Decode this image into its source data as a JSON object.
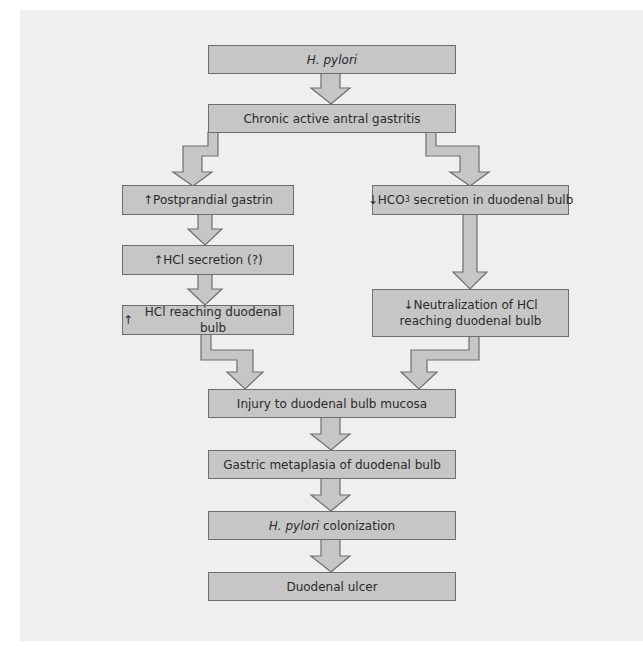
{
  "diagram": {
    "type": "flowchart",
    "nodes": [
      {
        "id": "n1",
        "label": "H. pylori",
        "italic": true
      },
      {
        "id": "n2",
        "label": "Chronic active antral gastritis"
      },
      {
        "id": "n3",
        "prefix": "↑",
        "label": "Postprandial gastrin"
      },
      {
        "id": "n4",
        "prefix": "↑",
        "label": "HCl secretion (?)"
      },
      {
        "id": "n5",
        "prefix": "↑",
        "label": "HCl reaching duodenal bulb"
      },
      {
        "id": "n6",
        "prefix": "↓",
        "label_a": "HCO",
        "label_sub": "3",
        "label_b": " secretion in duodenal bulb"
      },
      {
        "id": "n7",
        "prefix": "↓",
        "line1": "Neutralization of HCl",
        "line2": "reaching duodenal bulb"
      },
      {
        "id": "n8",
        "label": "Injury to duodenal bulb mucosa"
      },
      {
        "id": "n9",
        "label": "Gastric metaplasia of duodenal bulb"
      },
      {
        "id": "n10",
        "italic_part": "H. pylori",
        "rest": " colonization"
      },
      {
        "id": "n11",
        "label": "Duodenal ulcer"
      }
    ],
    "edges": [
      [
        "n1",
        "n2"
      ],
      [
        "n2",
        "n3"
      ],
      [
        "n2",
        "n6"
      ],
      [
        "n3",
        "n4"
      ],
      [
        "n4",
        "n5"
      ],
      [
        "n6",
        "n7"
      ],
      [
        "n5",
        "n8"
      ],
      [
        "n7",
        "n8"
      ],
      [
        "n8",
        "n9"
      ],
      [
        "n9",
        "n10"
      ],
      [
        "n10",
        "n11"
      ]
    ],
    "colors": {
      "panel": "#efefef",
      "box_fill": "#c6c6c6",
      "box_border": "#6e6e6e",
      "text": "#2a2a2a"
    }
  }
}
